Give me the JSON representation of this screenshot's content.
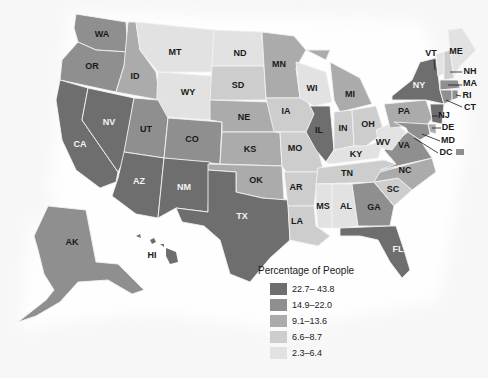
{
  "legend": {
    "title": "Percentage of People",
    "classes": [
      {
        "label": "22.7– 43.8",
        "color": "#6e6e6e"
      },
      {
        "label": "14.9–22.0",
        "color": "#8f8f8f"
      },
      {
        "label": "9.1–13.6",
        "color": "#ababab"
      },
      {
        "label": "6.6–8.7",
        "color": "#cdcdcd"
      },
      {
        "label": "2.3–6.4",
        "color": "#e2e2e2"
      }
    ]
  },
  "states": {
    "WA": {
      "label": "WA",
      "class": 1
    },
    "OR": {
      "label": "OR",
      "class": 1
    },
    "CA": {
      "label": "CA",
      "class": 0
    },
    "NV": {
      "label": "NV",
      "class": 0
    },
    "ID": {
      "label": "ID",
      "class": 2
    },
    "MT": {
      "label": "MT",
      "class": 4
    },
    "WY": {
      "label": "WY",
      "class": 4
    },
    "UT": {
      "label": "UT",
      "class": 1
    },
    "CO": {
      "label": "CO",
      "class": 1
    },
    "AZ": {
      "label": "AZ",
      "class": 0
    },
    "NM": {
      "label": "NM",
      "class": 0
    },
    "ND": {
      "label": "ND",
      "class": 4
    },
    "SD": {
      "label": "SD",
      "class": 3
    },
    "NE": {
      "label": "NE",
      "class": 2
    },
    "KS": {
      "label": "KS",
      "class": 2
    },
    "OK": {
      "label": "OK",
      "class": 2
    },
    "TX": {
      "label": "TX",
      "class": 0
    },
    "MN": {
      "label": "MN",
      "class": 2
    },
    "IA": {
      "label": "IA",
      "class": 3
    },
    "MO": {
      "label": "MO",
      "class": 3
    },
    "AR": {
      "label": "AR",
      "class": 3
    },
    "LA": {
      "label": "LA",
      "class": 3
    },
    "WI": {
      "label": "WI",
      "class": 4
    },
    "IL": {
      "label": "IL",
      "class": 0
    },
    "MI": {
      "label": "MI",
      "class": 2
    },
    "IN": {
      "label": "IN",
      "class": 3
    },
    "OH": {
      "label": "OH",
      "class": 3
    },
    "KY": {
      "label": "KY",
      "class": 4
    },
    "TN": {
      "label": "TN",
      "class": 3
    },
    "MS": {
      "label": "MS",
      "class": 4
    },
    "AL": {
      "label": "AL",
      "class": 4
    },
    "GA": {
      "label": "GA",
      "class": 1
    },
    "FL": {
      "label": "FL",
      "class": 0
    },
    "SC": {
      "label": "SC",
      "class": 3
    },
    "NC": {
      "label": "NC",
      "class": 2
    },
    "VA": {
      "label": "VA",
      "class": 1
    },
    "WV": {
      "label": "WV",
      "class": 4
    },
    "PA": {
      "label": "PA",
      "class": 2
    },
    "NY": {
      "label": "NY",
      "class": 0
    },
    "VT": {
      "label": "VT",
      "class": 4
    },
    "NH": {
      "label": "NH",
      "class": 3
    },
    "ME": {
      "label": "ME",
      "class": 4
    },
    "MA": {
      "label": "MA",
      "class": 1
    },
    "RI": {
      "label": "RI",
      "class": 1
    },
    "CT": {
      "label": "CT",
      "class": 1
    },
    "NJ": {
      "label": "NJ",
      "class": 0
    },
    "DE": {
      "label": "DE",
      "class": 2
    },
    "MD": {
      "label": "MD",
      "class": 1
    },
    "DC": {
      "label": "DC",
      "class": 1
    },
    "AK": {
      "label": "AK",
      "class": 1
    },
    "HI": {
      "label": "HI",
      "class": 0
    }
  }
}
